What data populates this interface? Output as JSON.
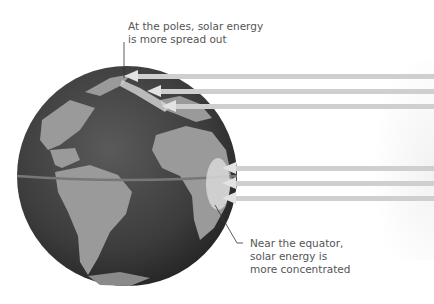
{
  "diagram": {
    "type": "solar-energy-distribution",
    "labels": {
      "poles": [
        "At the poles, solar energy",
        "is more spread out"
      ],
      "equator": [
        "Near the equator,",
        "solar energy is",
        "more concentrated"
      ]
    },
    "colors": {
      "ocean": "#3a3a3a",
      "land": "#9a9a9a",
      "ray": "#cfcfcf",
      "equator_line": "#777777",
      "text": "#555555"
    },
    "rays": {
      "polar_count": 3,
      "equatorial_count": 3
    }
  }
}
